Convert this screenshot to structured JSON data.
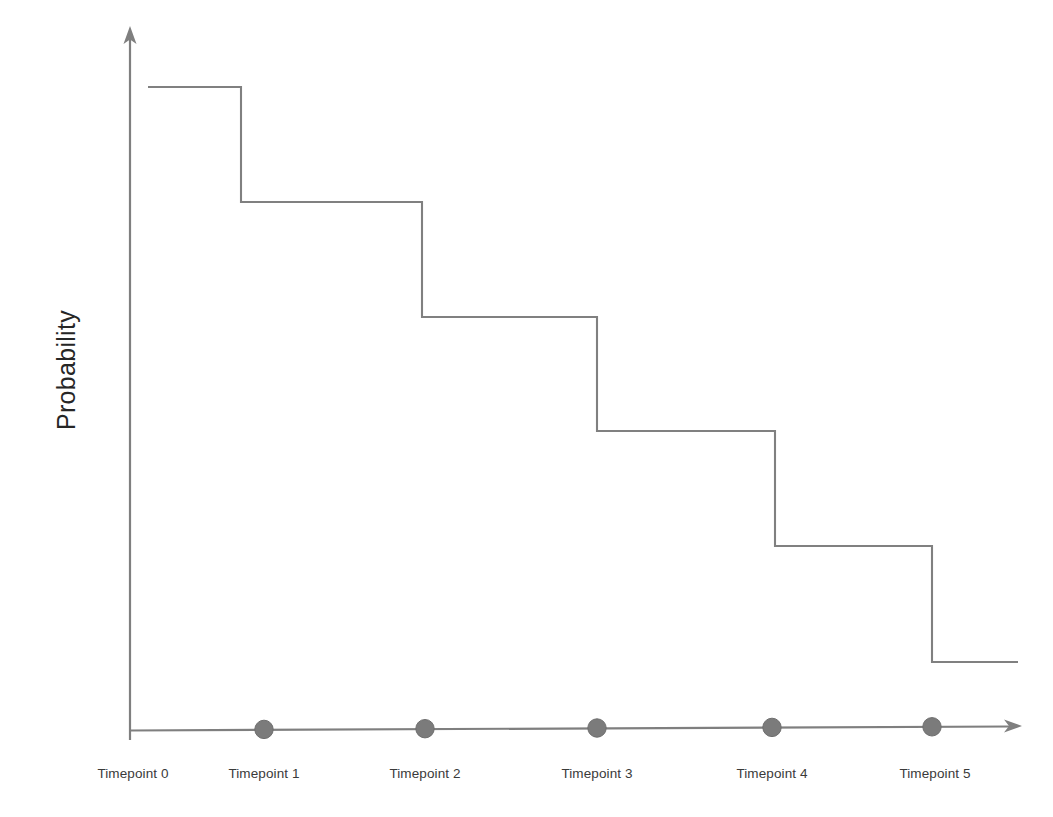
{
  "chart_data": {
    "type": "line",
    "subtype": "step",
    "title": "",
    "xlabel": "",
    "ylabel": "Probability",
    "categories": [
      "Timepoint 0",
      "Timepoint 1",
      "Timepoint 2",
      "Timepoint 3",
      "Timepoint 4",
      "Timepoint 5"
    ],
    "x": [
      0,
      1,
      2,
      3,
      4,
      5
    ],
    "values": [
      1.0,
      0.82,
      0.64,
      0.46,
      0.28,
      0.1
    ],
    "series": [
      {
        "name": "Probability",
        "values": [
          1.0,
          0.82,
          0.64,
          0.46,
          0.28,
          0.1
        ],
        "step_style": "post",
        "color": "#808080"
      }
    ],
    "ylim": [
      0,
      1.1
    ],
    "xlim": [
      0,
      5.6
    ],
    "grid": false,
    "legend": false,
    "legend_position": "none",
    "axis_arrows": true,
    "tick_labels_y": [],
    "annotations": [],
    "marker": {
      "shape": "circle",
      "color": "#7b7b7b",
      "edge_color": "#6e6e6e",
      "radius_px": 9,
      "on_axis": true
    }
  },
  "axes": {
    "y_label": "Probability",
    "x_tick_labels": [
      "Timepoint 0",
      "Timepoint 1",
      "Timepoint 2",
      "Timepoint 3",
      "Timepoint 4",
      "Timepoint 5"
    ]
  },
  "colors": {
    "axis": "#7f7f7f",
    "step_line": "#808080",
    "marker_fill": "#7b7b7b",
    "marker_edge": "#6e6e6e",
    "tick_text": "#3a3a3a",
    "axis_label_text": "#262626",
    "background": "#ffffff"
  },
  "geometry": {
    "y_axis_x": 130,
    "y_axis_top": 30,
    "x_axis_y": 729,
    "x_axis_right": 1020,
    "step_levels_y": [
      87,
      202,
      317,
      431,
      546,
      662
    ],
    "step_breaks_x": [
      148,
      241,
      422,
      597,
      775,
      932,
      1018
    ],
    "marker_cx": [
      264,
      425,
      597,
      772,
      932
    ],
    "label_cx": [
      133,
      264,
      425,
      597,
      772,
      935
    ],
    "label_y": 766
  }
}
